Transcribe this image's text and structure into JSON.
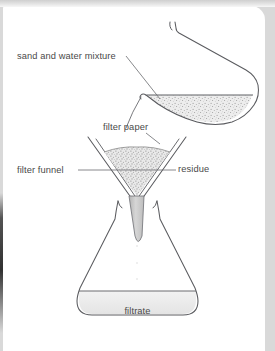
{
  "diagram": {
    "labels": {
      "mixture": "sand and water mixture",
      "filter_paper": "filter paper",
      "filter_funnel": "filter funnel",
      "residue": "residue",
      "filtrate": "filtrate"
    },
    "icons": {
      "beaker": "beaker-icon",
      "funnel": "funnel-icon",
      "flask": "conical-flask-icon",
      "residue_fill": "speckled-residue-icon",
      "mixture_fill": "speckled-liquid-icon"
    },
    "colors": {
      "outline": "#55565a",
      "label_text": "#4a4a4a",
      "speckle": "#9a9a9a",
      "liquid_fill": "#e8e8e8",
      "stem_fill": "#c9c9c9",
      "page_background": "#ffffff",
      "card_edge": "#d9d9d9"
    }
  }
}
